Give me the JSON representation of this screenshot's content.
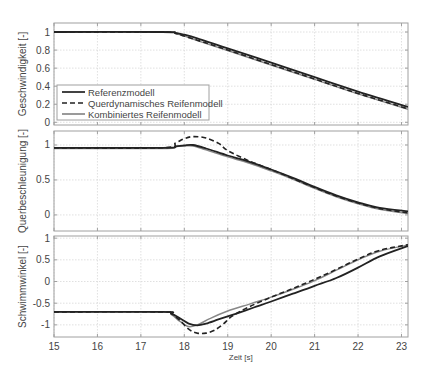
{
  "chart_data": [
    {
      "type": "line",
      "id": "geschwindigkeit",
      "title": "",
      "xlabel": "",
      "ylabel": "Geschwindigkeit [-]",
      "xlim": [
        15,
        23.15
      ],
      "ylim": [
        -0.03,
        1.1
      ],
      "yticks": [
        0,
        0.2,
        0.4,
        0.6,
        0.8,
        1
      ],
      "ytick_labels": [
        "0",
        "0.2",
        "0.4",
        "0.6",
        "0.8",
        "1"
      ],
      "xticks": [
        15,
        16,
        17,
        18,
        19,
        20,
        21,
        22,
        23
      ],
      "grid": true,
      "legend": {
        "position": "lower left",
        "entries": [
          "Referenzmodell",
          "Querdynamisches Reifenmodell",
          "Kombiniertes Reifenmodell"
        ]
      },
      "series": [
        {
          "name": "Referenzmodell",
          "style": "solid",
          "color": "#222222",
          "x": [
            15,
            17.5,
            17.8,
            18.0,
            18.3,
            19,
            20,
            21,
            22,
            23.15
          ],
          "y": [
            1,
            1,
            0.99,
            0.97,
            0.93,
            0.82,
            0.66,
            0.5,
            0.34,
            0.17
          ]
        },
        {
          "name": "Querdynamisches Reifenmodell",
          "style": "dashed",
          "color": "#222222",
          "x": [
            15,
            17.5,
            17.8,
            18.0,
            18.3,
            19,
            20,
            21,
            22,
            23.15
          ],
          "y": [
            1,
            1,
            0.985,
            0.955,
            0.91,
            0.8,
            0.64,
            0.48,
            0.32,
            0.15
          ]
        },
        {
          "name": "Kombiniertes Reifenmodell",
          "style": "solid",
          "color": "#888888",
          "x": [
            15,
            17.5,
            17.8,
            18.0,
            18.3,
            19,
            20,
            21,
            22,
            23.15
          ],
          "y": [
            1,
            1,
            0.985,
            0.955,
            0.905,
            0.795,
            0.635,
            0.475,
            0.315,
            0.145
          ]
        }
      ]
    },
    {
      "type": "line",
      "id": "querbeschleunigung",
      "title": "",
      "xlabel": "",
      "ylabel": "Querbeschleunigung [-]",
      "xlim": [
        15,
        23.15
      ],
      "ylim": [
        -0.23,
        1.2
      ],
      "yticks": [
        0,
        0.5,
        1
      ],
      "ytick_labels": [
        "0",
        "0.5",
        "1"
      ],
      "xticks": [
        15,
        16,
        17,
        18,
        19,
        20,
        21,
        22,
        23
      ],
      "grid": true,
      "series": [
        {
          "name": "Referenzmodell",
          "style": "solid",
          "color": "#222222",
          "x": [
            15,
            17.5,
            17.8,
            18.0,
            18.2,
            18.5,
            19,
            19.5,
            20,
            20.5,
            21,
            21.5,
            22,
            22.5,
            23.15
          ],
          "y": [
            0.96,
            0.96,
            0.98,
            0.995,
            1.0,
            0.95,
            0.85,
            0.76,
            0.65,
            0.53,
            0.4,
            0.28,
            0.18,
            0.1,
            0.05
          ]
        },
        {
          "name": "Querdynamisches Reifenmodell",
          "style": "dashed",
          "color": "#222222",
          "x": [
            15,
            17.5,
            17.8,
            18.0,
            18.2,
            18.5,
            18.8,
            19,
            19.5,
            20,
            20.5,
            21,
            21.5,
            22,
            22.5,
            23.15
          ],
          "y": [
            0.96,
            0.96,
            1.03,
            1.09,
            1.12,
            1.1,
            1.02,
            0.92,
            0.77,
            0.65,
            0.52,
            0.39,
            0.27,
            0.17,
            0.09,
            0.03
          ]
        },
        {
          "name": "Kombiniertes Reifenmodell",
          "style": "solid",
          "color": "#888888",
          "x": [
            15,
            17.5,
            17.8,
            18.0,
            18.2,
            18.5,
            19,
            19.5,
            20,
            20.5,
            21,
            21.5,
            22,
            22.5,
            23.15
          ],
          "y": [
            0.95,
            0.95,
            0.975,
            0.985,
            0.985,
            0.93,
            0.83,
            0.74,
            0.63,
            0.51,
            0.38,
            0.26,
            0.16,
            0.08,
            0.02
          ]
        }
      ]
    },
    {
      "type": "line",
      "id": "schwimmwinkel",
      "title": "",
      "xlabel": "Zeit [s]",
      "ylabel": "Schwimmwinkel [-]",
      "xlim": [
        15,
        23.15
      ],
      "ylim": [
        -1.28,
        1.05
      ],
      "yticks": [
        -1,
        -0.5,
        0,
        0.5,
        1
      ],
      "ytick_labels": [
        "-1",
        "-0.5",
        "0",
        "0.5",
        "1"
      ],
      "xticks": [
        15,
        16,
        17,
        18,
        19,
        20,
        21,
        22,
        23
      ],
      "xtick_labels": [
        "15",
        "16",
        "17",
        "18",
        "19",
        "20",
        "21",
        "22",
        "23"
      ],
      "grid": true,
      "series": [
        {
          "name": "Referenzmodell",
          "style": "solid",
          "color": "#222222",
          "x": [
            15,
            17.5,
            17.7,
            17.9,
            18.1,
            18.3,
            18.5,
            18.8,
            19.2,
            19.6,
            20,
            20.5,
            21,
            21.5,
            22,
            22.5,
            23.15
          ],
          "y": [
            -0.7,
            -0.7,
            -0.74,
            -0.85,
            -0.97,
            -1.01,
            -0.97,
            -0.87,
            -0.74,
            -0.6,
            -0.46,
            -0.28,
            -0.1,
            0.08,
            0.32,
            0.58,
            0.82
          ]
        },
        {
          "name": "Querdynamisches Reifenmodell",
          "style": "dashed",
          "color": "#222222",
          "x": [
            15,
            17.5,
            17.7,
            17.9,
            18.1,
            18.3,
            18.5,
            18.7,
            18.9,
            19.1,
            19.5,
            20,
            20.5,
            21,
            21.5,
            22,
            22.5,
            23.15
          ],
          "y": [
            -0.7,
            -0.7,
            -0.74,
            -0.9,
            -1.1,
            -1.19,
            -1.19,
            -1.12,
            -0.98,
            -0.8,
            -0.58,
            -0.36,
            -0.16,
            0.05,
            0.28,
            0.52,
            0.72,
            0.85
          ]
        },
        {
          "name": "Kombiniertes Reifenmodell",
          "style": "solid",
          "color": "#888888",
          "x": [
            15,
            17.5,
            17.7,
            17.9,
            18.1,
            18.3,
            18.6,
            19,
            19.5,
            20,
            20.5,
            21,
            21.5,
            22,
            22.5,
            23.15
          ],
          "y": [
            -0.7,
            -0.7,
            -0.76,
            -0.92,
            -1.04,
            -1.0,
            -0.85,
            -0.68,
            -0.52,
            -0.36,
            -0.18,
            0.02,
            0.26,
            0.5,
            0.7,
            0.84
          ]
        }
      ]
    }
  ],
  "layout": {
    "panels": [
      {
        "left": 54,
        "top": 23,
        "right": 408,
        "bottom": 125
      },
      {
        "left": 54,
        "top": 131,
        "right": 408,
        "bottom": 231
      },
      {
        "left": 54,
        "top": 236,
        "right": 408,
        "bottom": 337
      }
    ],
    "colors": {
      "axis": "#a0a0a0",
      "grid": "#d8d8d8",
      "text": "#444444"
    },
    "legend_box": {
      "left": 57,
      "top": 85,
      "width": 152,
      "height": 35
    }
  }
}
